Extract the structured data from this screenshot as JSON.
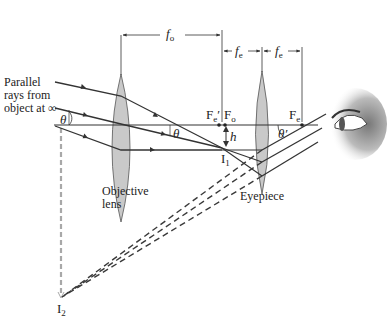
{
  "figure": {
    "type": "optics-ray-diagram",
    "colors": {
      "lens_fill": "#c9c9c9",
      "ray": "#333333",
      "dashed_virtual": "#3a3a3a",
      "dashed_axis": "#a8a8a8",
      "background": "#ffffff"
    }
  },
  "labels": {
    "parallel_rays_line1": "Parallel",
    "parallel_rays_line2": "rays from",
    "parallel_rays_line3": "object at ∞",
    "objective_line1": "Objective",
    "objective_line2": "lens",
    "eyepiece": "Eyepiece",
    "fo_main": "f",
    "fo_sub": "o",
    "fe1_main": "f",
    "fe1_sub": "e",
    "fe2_main": "f",
    "fe2_sub": "e",
    "Fe_prime_main": "F",
    "Fe_prime_sub": "e",
    "Fe_prime_mark": "′",
    "Fo_main": "F",
    "Fo_sub": "o",
    "Fe_main": "F",
    "Fe_sub": "e",
    "h": "h",
    "I1_main": "I",
    "I1_sub": "1",
    "I2_main": "I",
    "I2_sub": "2",
    "theta_left": "θ",
    "theta_mid": "θ",
    "theta_prime": "θ′"
  }
}
